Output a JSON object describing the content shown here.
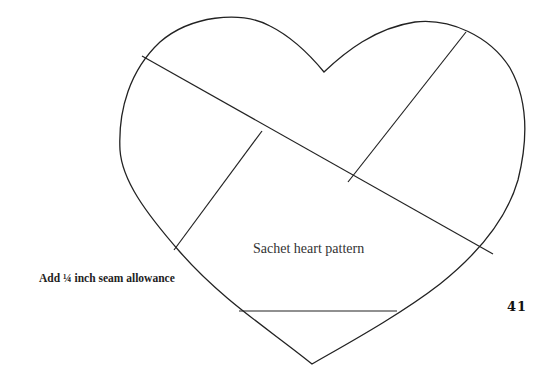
{
  "page": {
    "caption": "Add ¼ inch seam allowance",
    "pattern_label": "Sachet heart pattern",
    "page_number": "41"
  },
  "pattern": {
    "shape": "heart",
    "stroke_color": "#222222",
    "piece_count": 6
  }
}
